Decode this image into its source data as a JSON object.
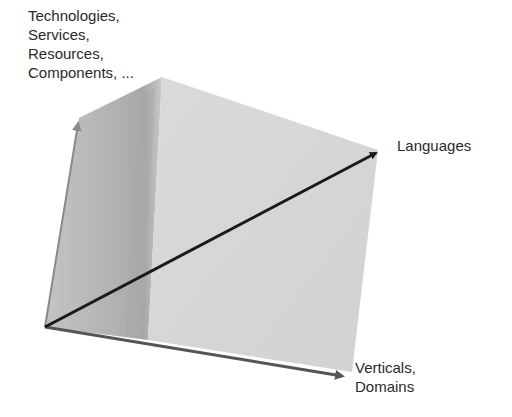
{
  "diagram": {
    "type": "3d-cube-axes",
    "axes": {
      "vertical": {
        "label_lines": [
          "Technologies,",
          "Services,",
          "Resources,",
          "Components, ..."
        ]
      },
      "diagonal": {
        "label_lines": [
          "Languages"
        ]
      },
      "horizontal": {
        "label_lines": [
          "Verticals,",
          "Domains"
        ]
      }
    },
    "colors": {
      "background": "#ffffff",
      "cube_left_face": "#b8b8b8",
      "cube_right_face": "#d6d6d6",
      "cube_shadow_band": "#a9a9a9",
      "diagonal_arrow": "#1a1a1a",
      "edge_arrow": "#555555",
      "label_text": "#2a2a2a"
    }
  }
}
